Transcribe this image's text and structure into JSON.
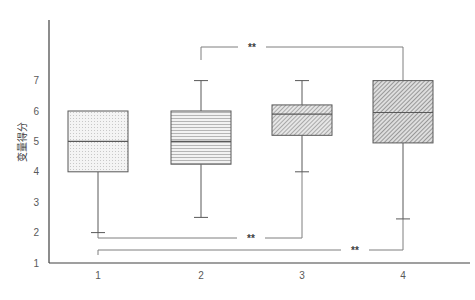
{
  "chart_data": {
    "type": "boxplot",
    "title": "",
    "xlabel": "",
    "ylabel": "变量得分",
    "categories": [
      "1",
      "2",
      "3",
      "4"
    ],
    "yticks": [
      "1",
      "2",
      "3",
      "4",
      "5",
      "6",
      "7"
    ],
    "ylim": [
      1,
      9
    ],
    "grid": false,
    "legend": null,
    "boxes": [
      {
        "category": "1",
        "whisker_low": 2.0,
        "q1": 4.0,
        "median": 5.0,
        "q3": 6.0,
        "whisker_high": 6.0,
        "pattern": "dots"
      },
      {
        "category": "2",
        "whisker_low": 2.5,
        "q1": 4.25,
        "median": 5.0,
        "q3": 6.0,
        "whisker_high": 7.0,
        "pattern": "horizontal-lines"
      },
      {
        "category": "3",
        "whisker_low": 4.0,
        "q1": 5.2,
        "median": 5.9,
        "q3": 6.2,
        "whisker_high": 7.0,
        "pattern": "diagonal-fine"
      },
      {
        "category": "4",
        "whisker_low": 2.45,
        "q1": 4.95,
        "median": 5.95,
        "q3": 7.0,
        "whisker_high": 7.0,
        "pattern": "diagonal-dense"
      }
    ],
    "significance": [
      {
        "from": "2",
        "to": "4",
        "label": "**",
        "y": 8.5
      },
      {
        "from": "1",
        "to": "3",
        "label": "**",
        "y": 1.85
      },
      {
        "from": "1",
        "to": "4",
        "label": "**",
        "y": 1.5
      }
    ]
  },
  "colors": {
    "axis": "#404040",
    "box_stroke": "#595959",
    "box_fill_light": "#e8e8e8",
    "box_fill_mid": "#d0d0d0",
    "hatch": "#7f7f7f",
    "bracket": "#7f7f7f"
  }
}
